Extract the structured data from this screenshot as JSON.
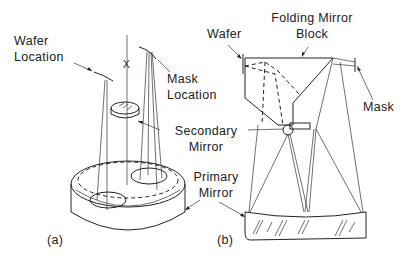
{
  "figure": {
    "panel_a": {
      "tag": "(a)",
      "labels": {
        "wafer_location": [
          "Wafer",
          "Location"
        ],
        "mask_location": [
          "Mask",
          "Location"
        ],
        "axis_marker": "X",
        "wafer_glyph": "F",
        "mask_glyph": "F"
      }
    },
    "panel_b": {
      "tag": "(b)",
      "labels": {
        "wafer": "Wafer",
        "folding_mirror_block": [
          "Folding Mirror",
          "Block"
        ],
        "mask": "Mask"
      }
    },
    "shared_labels": {
      "secondary_mirror": [
        "Secondary",
        "Mirror"
      ],
      "primary_mirror": [
        "Primary",
        "Mirror"
      ]
    }
  }
}
